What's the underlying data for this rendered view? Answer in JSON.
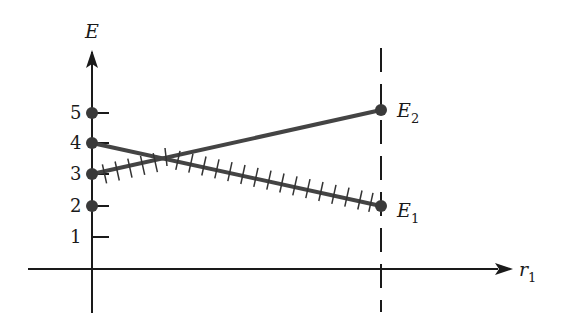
{
  "diagram": {
    "title": "",
    "y_axis": {
      "label": "E",
      "ticks": [
        "1",
        "2",
        "3",
        "4",
        "5"
      ]
    },
    "x_axis": {
      "label": "r",
      "label_subscript": "1"
    },
    "levels": {
      "upper": {
        "label": "E",
        "subscript": "2",
        "start_value": 3,
        "end_value": 5
      },
      "lower": {
        "label": "E",
        "subscript": "1",
        "start_value": 4,
        "end_value": 2
      }
    },
    "points_on_axis": [
      5,
      4,
      3,
      2
    ],
    "hatched_path": "lower-energy path: from 3 up to crossing, then down to E1",
    "dashed_line": "vertical at final r1",
    "colors": {
      "line": "#444444",
      "axis": "#1a1a1a",
      "dot": "#3a3a3a"
    }
  }
}
